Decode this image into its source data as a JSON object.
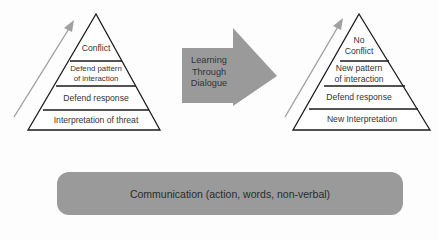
{
  "left_pyramid": {
    "levels": [
      {
        "label": "Conflict"
      },
      {
        "label": "Defend pattern\nof interaction"
      },
      {
        "label": "Defend response"
      },
      {
        "label": "Interpretation of threat"
      }
    ]
  },
  "center_arrow": {
    "label_lines": [
      "Learning",
      "Through",
      "Dialogue"
    ],
    "color": "#9a9a9a"
  },
  "right_pyramid": {
    "levels": [
      {
        "label": "No\nConflict"
      },
      {
        "label": "New pattern\nof interaction"
      },
      {
        "label": "Defend response"
      },
      {
        "label": "New Interpretation"
      }
    ]
  },
  "foundation": {
    "label": "Communication (action, words, non-verbal)",
    "color": "#9a9a9a"
  }
}
